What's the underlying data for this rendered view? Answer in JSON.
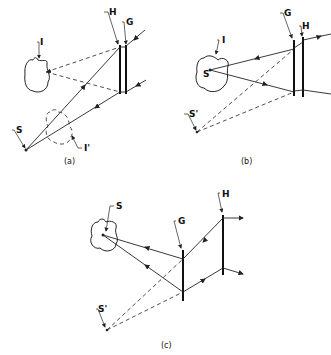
{
  "figure": {
    "panel_a": {
      "caption": "(a)",
      "labels": {
        "H": "H",
        "G": "G",
        "I": "I",
        "S": "S",
        "I_prime": "I'"
      }
    },
    "panel_b": {
      "caption": "(b)",
      "labels": {
        "G": "G",
        "H": "H",
        "I": "I",
        "S": "S",
        "S_prime": "S'"
      }
    },
    "panel_c": {
      "caption": "(c)",
      "labels": {
        "S": "S",
        "G": "G",
        "H": "H",
        "S_prime": "S'"
      }
    },
    "colors": {
      "ink": "#222222",
      "background": "#ffffff"
    }
  }
}
